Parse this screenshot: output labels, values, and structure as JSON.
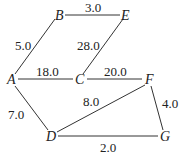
{
  "graph": {
    "nodes": {
      "A": {
        "label": "A",
        "x": 12,
        "y": 79
      },
      "B": {
        "label": "B",
        "x": 59,
        "y": 14
      },
      "C": {
        "label": "C",
        "x": 80,
        "y": 79
      },
      "D": {
        "label": "D",
        "x": 51,
        "y": 136
      },
      "E": {
        "label": "E",
        "x": 126,
        "y": 14
      },
      "F": {
        "label": "F",
        "x": 149,
        "y": 80
      },
      "G": {
        "label": "G",
        "x": 165,
        "y": 136
      }
    },
    "edges": [
      {
        "from": "B",
        "to": "E",
        "weight": "3.0"
      },
      {
        "from": "A",
        "to": "B",
        "weight": "5.0"
      },
      {
        "from": "C",
        "to": "E",
        "weight": "28.0"
      },
      {
        "from": "A",
        "to": "C",
        "weight": "18.0"
      },
      {
        "from": "C",
        "to": "F",
        "weight": "20.0"
      },
      {
        "from": "A",
        "to": "D",
        "weight": "7.0"
      },
      {
        "from": "D",
        "to": "F",
        "weight": "8.0"
      },
      {
        "from": "F",
        "to": "G",
        "weight": "4.0"
      },
      {
        "from": "D",
        "to": "G",
        "weight": "2.0"
      }
    ]
  }
}
